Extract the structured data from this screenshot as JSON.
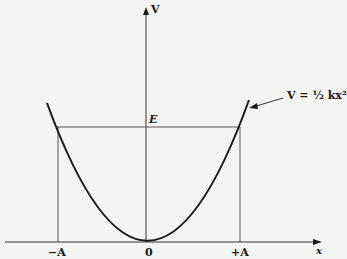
{
  "diagram": {
    "type": "potential-energy-parabola",
    "axes": {
      "y_label": "V",
      "x_label": "x"
    },
    "curve_label": "V = ½ kx²",
    "energy_level_label": "E",
    "ticks": {
      "neg_amplitude": "−A",
      "origin": "0",
      "pos_amplitude": "+A"
    },
    "colors": {
      "background": "#f4f4f2",
      "ink": "#1a1a1a",
      "thin_line": "#555555"
    }
  }
}
